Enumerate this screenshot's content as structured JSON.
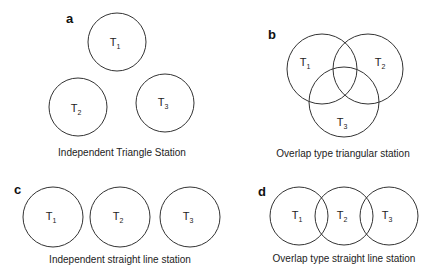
{
  "panels": [
    {
      "id": "a",
      "letter": "a",
      "caption": "Independent Triangle Station",
      "stations": [
        {
          "name": "T",
          "sub": "1",
          "cx": 117,
          "cy": 42,
          "r": 29
        },
        {
          "name": "T",
          "sub": "2",
          "cx": 78,
          "cy": 107,
          "r": 29
        },
        {
          "name": "T",
          "sub": "3",
          "cx": 165,
          "cy": 103,
          "r": 29
        }
      ]
    },
    {
      "id": "b",
      "letter": "b",
      "caption": "Overlap type triangular station",
      "stations": [
        {
          "name": "T",
          "sub": "1",
          "cx": 322,
          "cy": 70,
          "r": 35
        },
        {
          "name": "T",
          "sub": "2",
          "cx": 368,
          "cy": 70,
          "r": 35
        },
        {
          "name": "T",
          "sub": "3",
          "cx": 344,
          "cy": 102,
          "r": 35
        }
      ]
    },
    {
      "id": "c",
      "letter": "c",
      "caption": "Independent straight line station",
      "stations": [
        {
          "name": "T",
          "sub": "1",
          "cx": 53,
          "cy": 217,
          "r": 30
        },
        {
          "name": "T",
          "sub": "2",
          "cx": 120,
          "cy": 217,
          "r": 30
        },
        {
          "name": "T",
          "sub": "3",
          "cx": 190,
          "cy": 217,
          "r": 30
        }
      ]
    },
    {
      "id": "d",
      "letter": "d",
      "caption": "Overlap type straight line station",
      "stations": [
        {
          "name": "T",
          "sub": "1",
          "cx": 299,
          "cy": 216,
          "r": 29
        },
        {
          "name": "T",
          "sub": "2",
          "cx": 344,
          "cy": 216,
          "r": 29
        },
        {
          "name": "T",
          "sub": "3",
          "cx": 389,
          "cy": 216,
          "r": 29
        }
      ]
    }
  ]
}
